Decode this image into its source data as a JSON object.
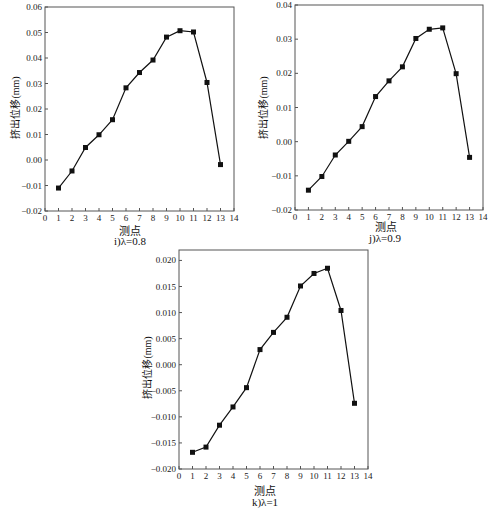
{
  "chart_data": [
    {
      "id": "i",
      "type": "line",
      "title": "",
      "caption": "i)λ=0.8",
      "xlabel": "测点",
      "ylabel": "挤出位移(mm)",
      "x": [
        1,
        2,
        3,
        4,
        5,
        6,
        7,
        8,
        9,
        10,
        11,
        12,
        13
      ],
      "values": [
        -0.011,
        -0.0043,
        0.0049,
        0.0099,
        0.0158,
        0.0283,
        0.0343,
        0.0392,
        0.0482,
        0.0507,
        0.0502,
        0.0304,
        -0.0018
      ],
      "xlim": [
        0,
        14
      ],
      "ylim": [
        -0.02,
        0.06
      ],
      "xticks": [
        "0",
        "1",
        "2",
        "3",
        "4",
        "5",
        "6",
        "7",
        "8",
        "9",
        "10",
        "11",
        "12",
        "13",
        "14"
      ],
      "yticks": [
        "-0.02",
        "-0.01",
        "0.00",
        "0.01",
        "0.02",
        "0.03",
        "0.04",
        "0.05",
        "0.06"
      ],
      "marker": "square",
      "grid": false
    },
    {
      "id": "j",
      "type": "line",
      "title": "",
      "caption": "j)λ=0.9",
      "xlabel": "测点",
      "ylabel": "挤出位移(mm)",
      "x": [
        1,
        2,
        3,
        4,
        5,
        6,
        7,
        8,
        9,
        10,
        11,
        12,
        13
      ],
      "values": [
        -0.0142,
        -0.0102,
        -0.0039,
        0.0001,
        0.0044,
        0.0132,
        0.0178,
        0.0219,
        0.0302,
        0.0329,
        0.0333,
        0.0199,
        -0.0046
      ],
      "xlim": [
        0,
        14
      ],
      "ylim": [
        -0.02,
        0.04
      ],
      "xticks": [
        "0",
        "1",
        "2",
        "3",
        "4",
        "5",
        "6",
        "7",
        "8",
        "9",
        "10",
        "11",
        "12",
        "13",
        "14"
      ],
      "yticks": [
        "-0.02",
        "-0.01",
        "0.00",
        "0.01",
        "0.02",
        "0.03",
        "0.04"
      ],
      "marker": "square",
      "grid": false
    },
    {
      "id": "k",
      "type": "line",
      "title": "",
      "caption": "k)λ=1",
      "xlabel": "测点",
      "ylabel": "挤出位移(mm)",
      "x": [
        1,
        2,
        3,
        4,
        5,
        6,
        7,
        8,
        9,
        10,
        11,
        12,
        13
      ],
      "values": [
        -0.0168,
        -0.0158,
        -0.0116,
        -0.0081,
        -0.0044,
        0.0029,
        0.0062,
        0.0091,
        0.0151,
        0.0175,
        0.0185,
        0.0104,
        -0.0074
      ],
      "xlim": [
        0,
        14
      ],
      "ylim": [
        -0.02,
        0.022
      ],
      "xticks": [
        "0",
        "1",
        "2",
        "3",
        "4",
        "5",
        "6",
        "7",
        "8",
        "9",
        "10",
        "11",
        "12",
        "13",
        "14"
      ],
      "yticks": [
        "-0.020",
        "-0.015",
        "-0.010",
        "-0.005",
        "0.000",
        "0.005",
        "0.010",
        "0.015",
        "0.020"
      ],
      "marker": "square",
      "grid": false
    }
  ],
  "panels": [
    {
      "caption": "i)λ=0.8",
      "xlabel": "测点",
      "ylabel": "挤出位移(mm)"
    },
    {
      "caption": "j)λ=0.9",
      "xlabel": "测点",
      "ylabel": "挤出位移(mm)"
    },
    {
      "caption": "k)λ=1",
      "xlabel": "测点",
      "ylabel": "挤出位移(mm)"
    }
  ],
  "colors": {
    "line": "#111111",
    "axis": "#555555",
    "marker": "#111111"
  }
}
